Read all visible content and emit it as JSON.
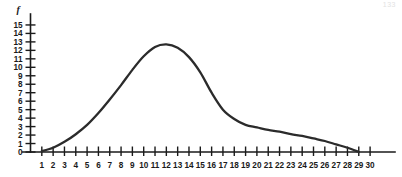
{
  "page": {
    "corner_mark": "133"
  },
  "chart_data": {
    "type": "line",
    "title": "",
    "subtitle": "",
    "xlabel": "",
    "ylabel": "f",
    "y_axis_name": "f",
    "grid": false,
    "legend": false,
    "legend_position": "none",
    "xlim": [
      0,
      30
    ],
    "ylim": [
      0,
      15
    ],
    "x_tick_labels": [
      "1",
      "2",
      "3",
      "4",
      "5",
      "6",
      "7",
      "8",
      "9",
      "10",
      "11",
      "12",
      "13",
      "14",
      "15",
      "16",
      "17",
      "18",
      "19",
      "20",
      "21",
      "22",
      "23",
      "24",
      "25",
      "26",
      "27",
      "28",
      "29",
      "30"
    ],
    "x_ticks": [
      1,
      2,
      3,
      4,
      5,
      6,
      7,
      8,
      9,
      10,
      11,
      12,
      13,
      14,
      15,
      16,
      17,
      18,
      19,
      20,
      21,
      22,
      23,
      24,
      25,
      26,
      27,
      28,
      29,
      30
    ],
    "y_tick_labels": [
      "0",
      "1",
      "2",
      "3",
      "4",
      "5",
      "6",
      "7",
      "8",
      "9",
      "10",
      "11",
      "12",
      "13",
      "14",
      "15"
    ],
    "y_ticks": [
      0,
      1,
      2,
      3,
      4,
      5,
      6,
      7,
      8,
      9,
      10,
      11,
      12,
      13,
      14,
      15
    ],
    "series": [
      {
        "name": "frequency",
        "x": [
          1,
          2,
          3,
          4,
          5,
          6,
          7,
          8,
          9,
          10,
          11,
          12,
          13,
          14,
          15,
          16,
          17,
          18,
          19,
          20,
          21,
          22,
          23,
          24,
          25,
          26,
          27,
          28,
          29
        ],
        "values": [
          0.1,
          0.5,
          1.2,
          2.1,
          3.2,
          4.6,
          6.2,
          7.9,
          9.7,
          11.3,
          12.4,
          12.7,
          12.3,
          11.2,
          9.4,
          7.0,
          5.0,
          3.9,
          3.2,
          2.9,
          2.6,
          2.4,
          2.1,
          1.9,
          1.6,
          1.3,
          0.9,
          0.5,
          0.0
        ]
      }
    ],
    "annotations": []
  }
}
